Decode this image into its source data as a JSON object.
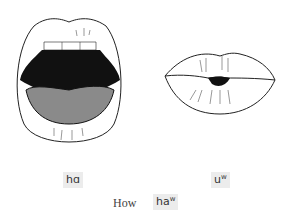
{
  "figures": [
    {
      "name": "open-mouth",
      "label_base": "h",
      "label_vowel": "ɑ",
      "label_sup": ""
    },
    {
      "name": "rounded-lips",
      "label_base": "u",
      "label_vowel": "",
      "label_sup": "w"
    }
  ],
  "caption": {
    "word": "How",
    "ipa_base": "ha",
    "ipa_sup": "w"
  },
  "colors": {
    "mouth_interior": "#111111",
    "tongue": "#8a8a8a",
    "outline": "#222222",
    "label_bg": "#ececec"
  }
}
